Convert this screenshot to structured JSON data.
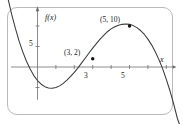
{
  "figure": {
    "kind": "coordinate-graph",
    "frame_color": "#b9b9b9",
    "curve_color": "#3a3a3a",
    "axis_color": "#6e6e6e",
    "text_color": "#1a1a1a"
  },
  "axes": {
    "y_axis_label": "f(x)",
    "x_axis_label": "x",
    "x_ticks": [
      {
        "value": 1,
        "label": ""
      },
      {
        "value": 2,
        "label": ""
      },
      {
        "value": 3,
        "label": "3"
      },
      {
        "value": 4,
        "label": ""
      },
      {
        "value": 5,
        "label": "5"
      },
      {
        "value": 6,
        "label": ""
      },
      {
        "value": 7,
        "label": ""
      }
    ],
    "y_ticks": [
      {
        "value": 5,
        "label": "5"
      },
      {
        "value": 10,
        "label": ""
      },
      {
        "value": -5,
        "label": ""
      }
    ]
  },
  "points": [
    {
      "label": "(3, 2)",
      "x": 3,
      "y": 2,
      "label_pos": "upper-left"
    },
    {
      "label": "(5, 10)",
      "x": 5,
      "y": 10,
      "label_pos": "upper-left"
    }
  ],
  "chart_data": {
    "type": "line",
    "title": "",
    "xlabel": "x",
    "ylabel": "f(x)",
    "xlim": [
      -1.6,
      7.9
    ],
    "ylim": [
      -12.5,
      16.5
    ],
    "grid": false,
    "legend": "none",
    "annotations": [
      "(3, 2)",
      "(5, 10)"
    ],
    "series": [
      {
        "name": "f(x)",
        "x": [
          -1.6,
          -1.4,
          -1.2,
          -1.0,
          -0.8,
          -0.6,
          -0.4,
          -0.2,
          0.0,
          0.2,
          0.4,
          0.6,
          0.8,
          1.0,
          1.2,
          1.4,
          1.6,
          1.8,
          2.0,
          2.2,
          2.4,
          2.6,
          2.8,
          3.0,
          3.2,
          3.4,
          3.6,
          3.8,
          4.0,
          4.2,
          4.4,
          4.6,
          4.8,
          5.0,
          5.2,
          5.4,
          5.6,
          5.8,
          6.0,
          6.2,
          6.4,
          6.6,
          6.8,
          7.0,
          7.2,
          7.4,
          7.6,
          7.9
        ],
        "y": [
          16.6,
          12.8,
          9.4,
          6.3,
          3.7,
          1.4,
          -0.5,
          -2.1,
          -3.3,
          -4.2,
          -4.8,
          -5.1,
          -5.2,
          -5.0,
          -4.6,
          -4.0,
          -3.2,
          -2.3,
          -1.3,
          -0.2,
          1.0,
          2.2,
          3.4,
          4.6,
          5.7,
          6.8,
          7.7,
          8.6,
          9.3,
          9.8,
          10.2,
          10.4,
          10.5,
          10.4,
          10.1,
          9.6,
          8.9,
          8.0,
          6.8,
          5.4,
          3.7,
          1.8,
          -0.4,
          -3.0,
          -5.8,
          -9.0,
          -12.5,
          -16.4
        ]
      }
    ],
    "marked_points": [
      {
        "x": 3,
        "y": 2,
        "label": "(3, 2)"
      },
      {
        "x": 5,
        "y": 10,
        "label": "(5, 10)"
      }
    ]
  }
}
